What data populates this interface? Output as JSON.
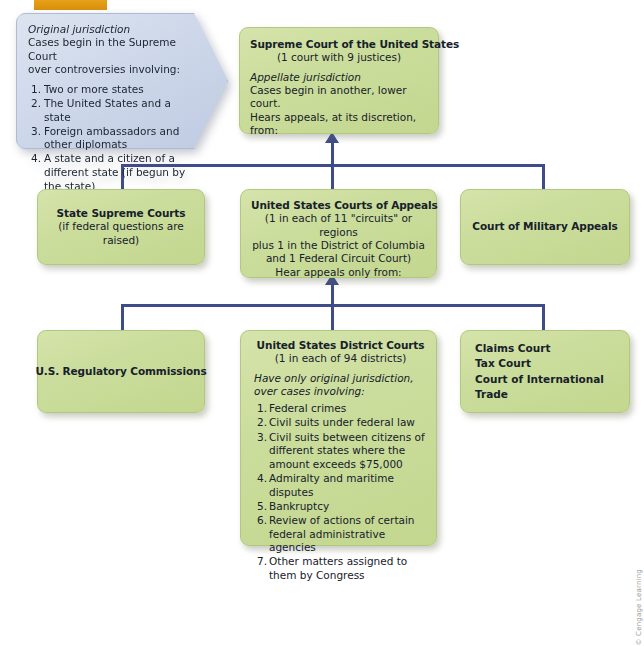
{
  "figure": {
    "credit": "© Cengage Learning",
    "accent_bar_color": "#e09a15",
    "box_color": "#cbdd9c",
    "callout_color": "#ced8ea",
    "connector_color": "#3f4c8c"
  },
  "callout": {
    "heading": "Original jurisdiction",
    "line1": "Cases begin in the Supreme Court",
    "line2": "over controversies involving:",
    "items": [
      {
        "num": "1.",
        "text": "Two or more states"
      },
      {
        "num": "2.",
        "text": "The United States and a state"
      },
      {
        "num": "3.",
        "text": "Foreign ambassadors and other diplomats"
      },
      {
        "num": "4.",
        "text": "A state and a citizen of a different state (if begun by the state)"
      }
    ]
  },
  "supreme_court": {
    "title": "Supreme Court of the United States",
    "subtitle": "(1 court with 9 justices)",
    "jurisdiction_heading": "Appellate jurisdiction",
    "line1": "Cases begin in another, lower court.",
    "line2": "Hears appeals, at its discretion, from:"
  },
  "state_supreme_courts": {
    "title": "State Supreme Courts",
    "subtitle": "(if federal questions are raised)"
  },
  "courts_of_appeals": {
    "title": "United States Courts of Appeals",
    "line1": "(1 in each of 11 \"circuits\" or regions",
    "line2": "plus 1 in the District of Columbia",
    "line3": "and 1 Federal Circuit Court)",
    "line4": "Hear appeals only from:"
  },
  "military_appeals": {
    "title": "Court of Military Appeals"
  },
  "regulatory_commissions": {
    "title": "U.S. Regulatory Commissions"
  },
  "district_courts": {
    "title": "United States District Courts",
    "subtitle": "(1 in each of 94 districts)",
    "jurisdiction_line1": "Have only original jurisdiction,",
    "jurisdiction_line2": "over cases involving:",
    "items": [
      {
        "num": "1.",
        "text": "Federal crimes"
      },
      {
        "num": "2.",
        "text": "Civil suits under federal law"
      },
      {
        "num": "3.",
        "text": "Civil suits between citizens of different states where the amount exceeds $75,000"
      },
      {
        "num": "4.",
        "text": "Admiralty and maritime disputes"
      },
      {
        "num": "5.",
        "text": "Bankruptcy"
      },
      {
        "num": "6.",
        "text": "Review of actions of certain federal administrative agencies"
      },
      {
        "num": "7.",
        "text": "Other matters assigned to them by Congress"
      }
    ]
  },
  "special_courts": {
    "line1": "Claims Court",
    "line2": "Tax Court",
    "line3": "Court of International Trade"
  }
}
